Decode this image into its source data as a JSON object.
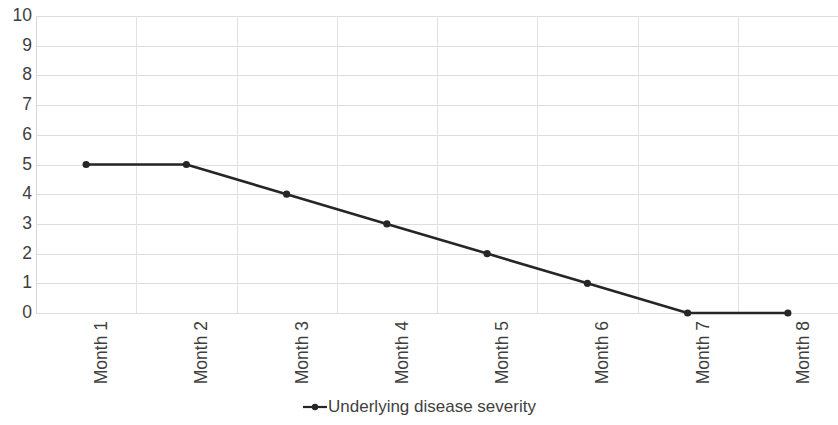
{
  "chart_data": {
    "type": "line",
    "title": "",
    "xlabel": "",
    "ylabel": "",
    "categories": [
      "Month 1",
      "Month 2",
      "Month 3",
      "Month 4",
      "Month 5",
      "Month 6",
      "Month 7",
      "Month 8"
    ],
    "series": [
      {
        "name": "Underlying disease severity",
        "values": [
          5,
          5,
          4,
          3,
          2,
          1,
          0,
          0
        ],
        "color": "#262626",
        "marker": "circle"
      }
    ],
    "ylim": [
      0,
      10
    ],
    "ytick_labels": [
      "10",
      "9",
      "8",
      "7",
      "6",
      "5",
      "4",
      "3",
      "2",
      "1",
      "0"
    ],
    "ytick_values": [
      10,
      9,
      8,
      7,
      6,
      5,
      4,
      3,
      2,
      1,
      0
    ],
    "grid": {
      "horizontal": true,
      "vertical": true,
      "color": "#dddddd"
    },
    "legend": {
      "position": "bottom",
      "entries": [
        "Underlying disease severity"
      ]
    },
    "axis_color": "#d6d6d6",
    "text_color": "#3f3f3f",
    "background": "#ffffff",
    "xtick_rotation": -90
  }
}
